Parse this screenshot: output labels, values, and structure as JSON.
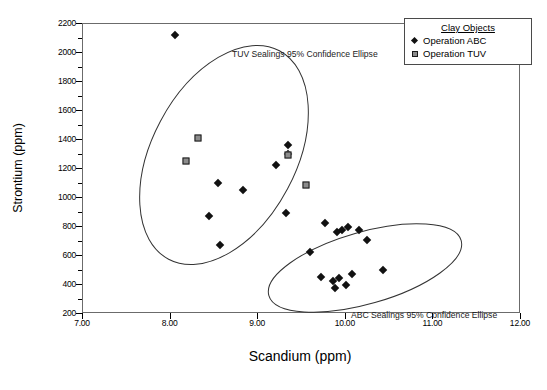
{
  "chart_data": {
    "type": "scatter",
    "title": "",
    "xlabel": "Scandium (ppm)",
    "ylabel": "Strontium (ppm)",
    "xlim": [
      7.0,
      12.0
    ],
    "ylim": [
      130,
      2200
    ],
    "xticks": [
      "7.00",
      "8.00",
      "9.00",
      "10.00",
      "11.00",
      "12.00"
    ],
    "yticks": [
      "200",
      "400",
      "600",
      "800",
      "1000",
      "1200",
      "1400",
      "1600",
      "1800",
      "2000",
      "2200"
    ],
    "grid": false,
    "legend_position": "top-right",
    "legend_title": "Clay Objects",
    "series": [
      {
        "name": "Operation ABC",
        "marker": "diamond",
        "color": "#111111",
        "points": [
          {
            "x": 8.06,
            "y": 2120
          },
          {
            "x": 8.45,
            "y": 870
          },
          {
            "x": 8.55,
            "y": 1100
          },
          {
            "x": 8.84,
            "y": 1050
          },
          {
            "x": 8.58,
            "y": 670
          },
          {
            "x": 9.21,
            "y": 1220
          },
          {
            "x": 9.33,
            "y": 890
          },
          {
            "x": 9.35,
            "y": 1300
          },
          {
            "x": 9.35,
            "y": 1360
          },
          {
            "x": 9.77,
            "y": 820
          },
          {
            "x": 9.6,
            "y": 620
          },
          {
            "x": 9.91,
            "y": 760
          },
          {
            "x": 9.97,
            "y": 775
          },
          {
            "x": 10.04,
            "y": 790
          },
          {
            "x": 10.16,
            "y": 775
          },
          {
            "x": 10.25,
            "y": 705
          },
          {
            "x": 9.73,
            "y": 450
          },
          {
            "x": 9.86,
            "y": 420
          },
          {
            "x": 9.93,
            "y": 440
          },
          {
            "x": 9.89,
            "y": 370
          },
          {
            "x": 10.01,
            "y": 390
          },
          {
            "x": 10.08,
            "y": 470
          },
          {
            "x": 10.44,
            "y": 500
          }
        ]
      },
      {
        "name": "Operation TUV",
        "marker": "square",
        "color": "#8c8c8c",
        "points": [
          {
            "x": 8.32,
            "y": 1410
          },
          {
            "x": 8.19,
            "y": 1250
          },
          {
            "x": 9.35,
            "y": 1290
          },
          {
            "x": 9.56,
            "y": 1080
          }
        ]
      }
    ],
    "ellipses": [
      {
        "label": "TUV Sealings 95% Confidence Ellipse",
        "cx": 224,
        "cy": 155,
        "rx": 118,
        "ry": 72,
        "rotation": -62
      },
      {
        "label": "ABC Sealings 95% Confidence Ellipse",
        "cx": 365,
        "cy": 268,
        "rx": 100,
        "ry": 36,
        "rotation": -16
      }
    ]
  },
  "legend": {
    "title": "Clay Objects",
    "entries": [
      {
        "label": "Operation ABC",
        "marker": "diamond"
      },
      {
        "label": "Operation TUV",
        "marker": "square"
      }
    ]
  },
  "annotations": {
    "tuv": "TUV Sealings 95% Confidence Ellipse",
    "abc": "ABC Sealings 95% Confidence Ellipse"
  },
  "axes": {
    "x_title": "Scandium (ppm)",
    "y_title": "Strontium (ppm)"
  }
}
